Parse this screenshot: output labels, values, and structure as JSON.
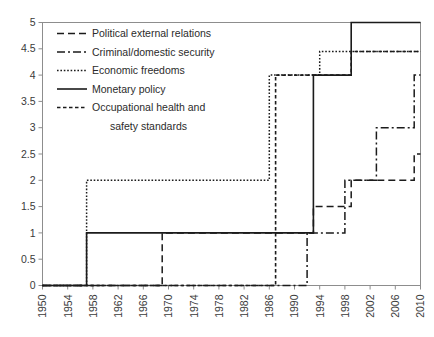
{
  "chart_data": {
    "type": "line",
    "title": "",
    "subtitle": "",
    "xlabel": "",
    "ylabel": "",
    "xlim": [
      1950,
      2010
    ],
    "ylim": [
      0,
      5
    ],
    "grid": false,
    "legend_position": "inside top-left",
    "step_type": "post",
    "x_ticks": [
      "1950",
      "1954",
      "1958",
      "1962",
      "1966",
      "1970",
      "1974",
      "1978",
      "1982",
      "1986",
      "1990",
      "1994",
      "1998",
      "2002",
      "2006",
      "2010"
    ],
    "x_tick_values": [
      1950,
      1954,
      1958,
      1962,
      1966,
      1970,
      1974,
      1978,
      1982,
      1986,
      1990,
      1994,
      1998,
      2002,
      2006,
      2010
    ],
    "y_ticks": [
      "0",
      "0.5",
      "1",
      "1.5",
      "2",
      "2.5",
      "3",
      "3.5",
      "4",
      "4.5",
      "5"
    ],
    "y_tick_values": [
      0,
      0.5,
      1,
      1.5,
      2,
      2.5,
      3,
      3.5,
      4,
      4.5,
      5
    ],
    "series": [
      {
        "name": "Political external relations",
        "style": "long-dash",
        "dasharray": "7,4",
        "width": 1.5,
        "color": "#1b1b1b",
        "x": [
          1950,
          1969,
          1969,
          1993,
          1993,
          1999,
          1999,
          2009,
          2009,
          2010
        ],
        "y": [
          0,
          0,
          1,
          1,
          1.5,
          1.5,
          2,
          2,
          2.5,
          2.5
        ]
      },
      {
        "name": "Criminal/domestic security",
        "style": "dash-dot",
        "dasharray": "8,3,2,3",
        "width": 1.5,
        "color": "#1b1b1b",
        "x": [
          1950,
          1992,
          1992,
          1998,
          1998,
          2003,
          2003,
          2009,
          2009,
          2010
        ],
        "y": [
          0,
          0,
          1,
          1,
          2,
          2,
          3,
          3,
          4,
          4
        ]
      },
      {
        "name": "Economic freedoms",
        "style": "dotted",
        "dasharray": "1.6,1.8",
        "width": 1.5,
        "color": "#1b1b1b",
        "x": [
          1950,
          1957,
          1957,
          1986,
          1986,
          1994,
          1994,
          2010
        ],
        "y": [
          0,
          0,
          2,
          2,
          4,
          4,
          4.45,
          4.45
        ]
      },
      {
        "name": "Monetary policy",
        "style": "solid",
        "dasharray": "none",
        "width": 1.6,
        "color": "#1b1b1b",
        "x": [
          1950,
          1957,
          1957,
          1993,
          1993,
          1999,
          1999,
          2010
        ],
        "y": [
          0,
          0,
          1,
          1,
          4,
          4,
          5,
          5
        ]
      },
      {
        "name": "Occupational health and safety standards",
        "style": "short-dash",
        "dasharray": "3.5,2.5",
        "width": 1.6,
        "color": "#1b1b1b",
        "x": [
          1950,
          1987,
          1987,
          1999,
          1999,
          2010
        ],
        "y": [
          0,
          0,
          4,
          4,
          4.45,
          4.45
        ]
      }
    ],
    "legend_entries": [
      {
        "label": "Political external relations",
        "style": "long-dash",
        "dasharray": "7,4",
        "width": 1.5
      },
      {
        "label": "Criminal/domestic security",
        "style": "dash-dot",
        "dasharray": "8,3,2,3",
        "width": 1.5
      },
      {
        "label": "Economic freedoms",
        "style": "dotted",
        "dasharray": "1.6,1.8",
        "width": 1.5
      },
      {
        "label": "Monetary policy",
        "style": "solid",
        "dasharray": "none",
        "width": 1.6
      },
      {
        "label": "Occupational health and",
        "style": "short-dash",
        "dasharray": "3.5,2.5",
        "width": 1.6
      },
      {
        "label": "safety standards",
        "style": "none",
        "dasharray": "none",
        "width": 0
      }
    ],
    "colors": {
      "series_stroke": "#1b1b1b",
      "axis": "#8d8d8d",
      "tick_text": "#3a3a3a",
      "legend_text": "#2b2b2b",
      "background": "#ffffff"
    }
  }
}
